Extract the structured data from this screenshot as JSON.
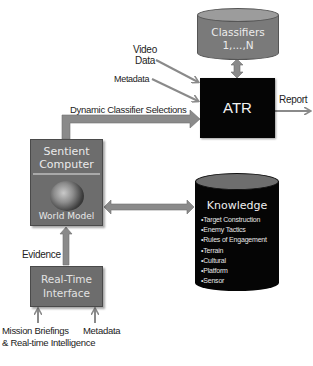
{
  "diagram": {
    "nodes": {
      "classifiers": {
        "line1": "Classifiers",
        "line2": "1,...,N",
        "shape": "cylinder",
        "color": "#7a7a7a"
      },
      "atr": {
        "label": "ATR",
        "shape": "box",
        "color": "#050505"
      },
      "sentient_computer": {
        "title_line1": "Sentient",
        "title_line2": "Computer",
        "subtitle": "World Model",
        "icon": "globe-icon",
        "color": "#6d6d6d"
      },
      "knowledge": {
        "title": "Knowledge",
        "shape": "cylinder",
        "color": "#050505",
        "items": [
          "Target Construction",
          "Enemy Tactics",
          "Rules of Engagement",
          "Terrain",
          "Cultural",
          "Platform",
          "Sensor"
        ]
      },
      "real_time_interface": {
        "line1": "Real-Time",
        "line2": "Interface",
        "color": "#6d6d6d"
      }
    },
    "edge_labels": {
      "video_data_line1": "Video",
      "video_data_line2": "Data",
      "metadata_top": "Metadata",
      "report": "Report",
      "dynamic_classifier_selections": "Dynamic Classifier Selections",
      "evidence": "Evidence",
      "mission_briefings_line1": "Mission Briefings",
      "mission_briefings_line2": "& Real-time Intelligence",
      "metadata_bottom": "Metadata"
    },
    "edges": [
      {
        "from": "Video Data",
        "to": "ATR"
      },
      {
        "from": "Metadata",
        "to": "ATR"
      },
      {
        "from": "Classifiers",
        "to": "ATR",
        "bidirectional": true
      },
      {
        "from": "ATR",
        "to": "Report"
      },
      {
        "from": "Sentient Computer",
        "to": "ATR",
        "label": "Dynamic Classifier Selections"
      },
      {
        "from": "Sentient Computer",
        "to": "Knowledge",
        "bidirectional": true
      },
      {
        "from": "Real-Time Interface",
        "to": "Sentient Computer",
        "label": "Evidence"
      },
      {
        "from": "Mission Briefings & Real-time Intelligence",
        "to": "Real-Time Interface"
      },
      {
        "from": "Metadata",
        "to": "Real-Time Interface"
      }
    ],
    "arrow_color": "#8a8a8a"
  }
}
